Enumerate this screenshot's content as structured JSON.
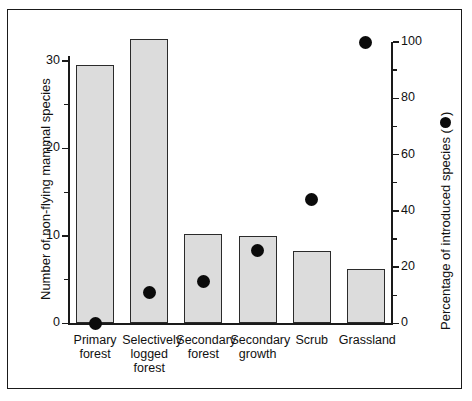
{
  "figure": {
    "background_color": "#ffffff",
    "frame_color": "#1a1a1a",
    "bar_fill_color": "#dcdcdc",
    "bar_edge_color": "#2b2b2b",
    "dot_color": "#0b0b0b"
  },
  "chart_data": {
    "type": "bar",
    "title": "",
    "xlabel": "",
    "ylabel": "Number of non-flying mammal species",
    "y2label": "Percentage of introduced species (",
    "y2label_suffix": ")",
    "y2label_legend_icon": "filled-circle-marker",
    "grid": false,
    "legend_position": "axis-label",
    "categories": [
      "Primary\nforest",
      "Selectively\nlogged\nforest",
      "Secondary\nforest",
      "Secondary\ngrowth",
      "Scrub",
      "Grassland"
    ],
    "categories_flat": [
      "Primary forest",
      "Selectively logged forest",
      "Secondary forest",
      "Secondary growth",
      "Scrub",
      "Grassland"
    ],
    "series": [
      {
        "name": "Number of non-flying mammal species",
        "render": "bar",
        "axis": "left",
        "values": [
          29.5,
          32.5,
          10.2,
          10.0,
          8.3,
          6.2
        ]
      },
      {
        "name": "Percentage of introduced species",
        "render": "scatter",
        "axis": "right",
        "marker": "filled-circle",
        "values": [
          0,
          11,
          15,
          26,
          44,
          100
        ]
      }
    ],
    "ylim": [
      0,
      32.5
    ],
    "yticks": [
      0,
      10,
      20,
      30
    ],
    "yticklabels": [
      "0",
      "10",
      "20",
      "30"
    ],
    "yminorticks": [
      5,
      15,
      25
    ],
    "y2lim": [
      0,
      100
    ],
    "y2ticks": [
      0,
      20,
      40,
      60,
      80,
      100
    ],
    "y2ticklabels": [
      "0",
      "20",
      "40",
      "60",
      "80",
      "100"
    ],
    "y2minorticks": [
      10,
      30,
      50,
      70,
      90
    ]
  }
}
